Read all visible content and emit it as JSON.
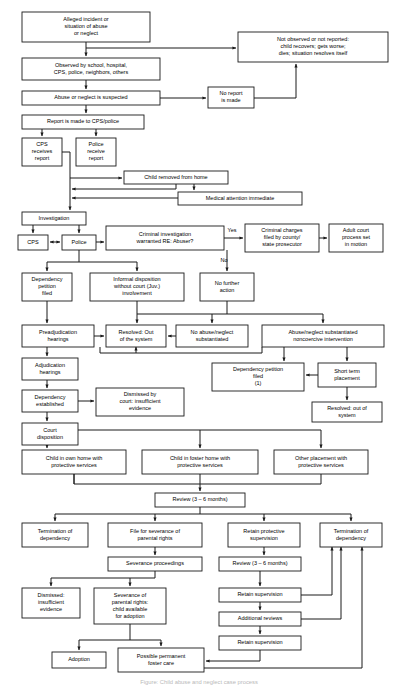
{
  "diagram": {
    "caption": "Figure: Child abuse and neglect case process",
    "type": "flowchart",
    "colors": {
      "box_fill": "#ffffff",
      "box_stroke": "#1a1a1a",
      "connector": "#1a1a1a",
      "text": "#000000",
      "caption_text": "#b9b9b9"
    },
    "nodes": [
      {
        "id": "n1",
        "lines": [
          "Alleged incident or",
          "situation of abuse",
          "or neglect"
        ],
        "x": 22,
        "y": 12,
        "w": 128,
        "h": 30
      },
      {
        "id": "n2",
        "lines": [
          "Not observed or not reported:",
          "child recovers; gets worse;",
          "dies; situation resolves itself"
        ],
        "x": 238,
        "y": 32,
        "w": 150,
        "h": 30
      },
      {
        "id": "n3",
        "lines": [
          "Observed by school, hospital,",
          "CPS, police, neighbors, others"
        ],
        "x": 22,
        "y": 58,
        "w": 138,
        "h": 22
      },
      {
        "id": "n4",
        "lines": [
          "Abuse or neglect is suspected"
        ],
        "x": 22,
        "y": 91,
        "w": 138,
        "h": 14
      },
      {
        "id": "n5",
        "lines": [
          "No report",
          "is made"
        ],
        "x": 208,
        "y": 87,
        "w": 46,
        "h": 21
      },
      {
        "id": "n6",
        "lines": [
          "Report is made to CPS/police"
        ],
        "x": 22,
        "y": 115,
        "w": 122,
        "h": 14
      },
      {
        "id": "n7",
        "lines": [
          "CPS",
          "receives",
          "report"
        ],
        "x": 22,
        "y": 138,
        "w": 40,
        "h": 28
      },
      {
        "id": "n8",
        "lines": [
          "Police",
          "receive",
          "report"
        ],
        "x": 76,
        "y": 138,
        "w": 40,
        "h": 28
      },
      {
        "id": "n9",
        "lines": [
          "Child removed from home"
        ],
        "x": 124,
        "y": 171,
        "w": 104,
        "h": 13
      },
      {
        "id": "n10",
        "lines": [
          "Medical attention immediate"
        ],
        "x": 178,
        "y": 192,
        "w": 124,
        "h": 13
      },
      {
        "id": "n11",
        "lines": [
          "Investigation"
        ],
        "x": 22,
        "y": 212,
        "w": 64,
        "h": 13
      },
      {
        "id": "n12",
        "lines": [
          "CPS"
        ],
        "x": 18,
        "y": 235,
        "w": 30,
        "h": 15
      },
      {
        "id": "n13",
        "lines": [
          "Police"
        ],
        "x": 62,
        "y": 235,
        "w": 34,
        "h": 15
      },
      {
        "id": "n14",
        "lines": [
          "Criminal investigation",
          "warranted RE: Abuser?"
        ],
        "x": 106,
        "y": 226,
        "w": 118,
        "h": 24
      },
      {
        "id": "n15",
        "lines": [
          "Criminal charges",
          "filed by county/",
          "state prosecutor"
        ],
        "x": 245,
        "y": 224,
        "w": 74,
        "h": 28
      },
      {
        "id": "n16",
        "lines": [
          "Adult court",
          "process set",
          "in motion"
        ],
        "x": 329,
        "y": 224,
        "w": 54,
        "h": 28
      },
      {
        "id": "n17",
        "lines": [
          "No further",
          "action"
        ],
        "x": 200,
        "y": 273,
        "w": 54,
        "h": 28
      },
      {
        "id": "n18",
        "lines": [
          "Dependency",
          "petition",
          "filed"
        ],
        "x": 22,
        "y": 273,
        "w": 50,
        "h": 28
      },
      {
        "id": "n19",
        "lines": [
          "Informal disposition",
          "without court (Juv.)",
          "involvement"
        ],
        "x": 90,
        "y": 273,
        "w": 94,
        "h": 28
      },
      {
        "id": "n20",
        "lines": [
          "Preadjudication",
          "hearings"
        ],
        "x": 22,
        "y": 325,
        "w": 72,
        "h": 22
      },
      {
        "id": "n21",
        "lines": [
          "Resolved: Out",
          "of the system"
        ],
        "x": 106,
        "y": 325,
        "w": 60,
        "h": 22
      },
      {
        "id": "n22",
        "lines": [
          "No abuse/neglect",
          "substantiated"
        ],
        "x": 176,
        "y": 325,
        "w": 72,
        "h": 22
      },
      {
        "id": "n23",
        "lines": [
          "Abuse/neglect substantiated",
          "noncoercive intervention"
        ],
        "x": 262,
        "y": 325,
        "w": 122,
        "h": 22
      },
      {
        "id": "n24",
        "lines": [
          "Adjudication",
          "hearings"
        ],
        "x": 22,
        "y": 358,
        "w": 56,
        "h": 22
      },
      {
        "id": "n25",
        "lines": [
          "Dependency petition",
          "filed",
          "(1)"
        ],
        "x": 212,
        "y": 363,
        "w": 92,
        "h": 28
      },
      {
        "id": "n26",
        "lines": [
          "Short term",
          "placement"
        ],
        "x": 318,
        "y": 363,
        "w": 58,
        "h": 24
      },
      {
        "id": "n27",
        "lines": [
          "Dependency",
          "established"
        ],
        "x": 22,
        "y": 390,
        "w": 56,
        "h": 22
      },
      {
        "id": "n28",
        "lines": [
          "Dismissed by",
          "court: insufficient",
          "evidence"
        ],
        "x": 96,
        "y": 388,
        "w": 88,
        "h": 28
      },
      {
        "id": "n29",
        "lines": [
          "Resolved: out of",
          "system"
        ],
        "x": 312,
        "y": 402,
        "w": 70,
        "h": 20
      },
      {
        "id": "n30",
        "lines": [
          "Court",
          "disposition"
        ],
        "x": 22,
        "y": 423,
        "w": 56,
        "h": 22
      },
      {
        "id": "n31",
        "lines": [
          "Child in own home with",
          "protective services"
        ],
        "x": 22,
        "y": 450,
        "w": 104,
        "h": 24
      },
      {
        "id": "n32",
        "lines": [
          "Child in foster home with",
          "protective services"
        ],
        "x": 142,
        "y": 450,
        "w": 116,
        "h": 24
      },
      {
        "id": "n33",
        "lines": [
          "Other placement with",
          "protective services"
        ],
        "x": 274,
        "y": 450,
        "w": 94,
        "h": 24
      },
      {
        "id": "n34",
        "lines": [
          "Review (3 – 6 months)"
        ],
        "x": 155,
        "y": 493,
        "w": 90,
        "h": 14
      },
      {
        "id": "n35",
        "lines": [
          "Termination of",
          "dependency"
        ],
        "x": 22,
        "y": 523,
        "w": 66,
        "h": 24
      },
      {
        "id": "n36",
        "lines": [
          "File for severance of",
          "parental rights"
        ],
        "x": 108,
        "y": 523,
        "w": 94,
        "h": 24
      },
      {
        "id": "n37",
        "lines": [
          "Retain protective",
          "supervision"
        ],
        "x": 228,
        "y": 523,
        "w": 72,
        "h": 24
      },
      {
        "id": "n38",
        "lines": [
          "Termination of",
          "dependency"
        ],
        "x": 320,
        "y": 523,
        "w": 62,
        "h": 24
      },
      {
        "id": "n39",
        "lines": [
          "Severance proceedings"
        ],
        "x": 108,
        "y": 557,
        "w": 94,
        "h": 14
      },
      {
        "id": "n40",
        "lines": [
          "Review (3 – 6 months)"
        ],
        "x": 219,
        "y": 557,
        "w": 82,
        "h": 14
      },
      {
        "id": "n41",
        "lines": [
          "Dismissed:",
          "insufficient",
          "evidence"
        ],
        "x": 22,
        "y": 588,
        "w": 58,
        "h": 30
      },
      {
        "id": "n42",
        "lines": [
          "Severance of",
          "parental rights:",
          "child available",
          "for adoption"
        ],
        "x": 94,
        "y": 588,
        "w": 72,
        "h": 36
      },
      {
        "id": "n43",
        "lines": [
          "Retain supervision"
        ],
        "x": 219,
        "y": 588,
        "w": 82,
        "h": 14
      },
      {
        "id": "n44",
        "lines": [
          "Additional reviews"
        ],
        "x": 219,
        "y": 612,
        "w": 82,
        "h": 14
      },
      {
        "id": "n45",
        "lines": [
          "Retain supervision"
        ],
        "x": 219,
        "y": 636,
        "w": 82,
        "h": 14
      },
      {
        "id": "n46",
        "lines": [
          "Adoption"
        ],
        "x": 52,
        "y": 652,
        "w": 54,
        "h": 16
      },
      {
        "id": "n47",
        "lines": [
          "Possible permanent",
          "foster care"
        ],
        "x": 118,
        "y": 648,
        "w": 86,
        "h": 24
      }
    ],
    "edge_labels": [
      {
        "id": "lbl_yes",
        "text": "Yes",
        "x": 232,
        "y": 232
      },
      {
        "id": "lbl_no",
        "text": "No",
        "x": 224,
        "y": 262
      }
    ]
  }
}
